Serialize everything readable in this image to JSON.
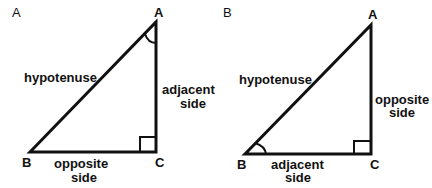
{
  "panels": [
    {
      "label": "A",
      "vertices": {
        "A": "A",
        "B": "B",
        "C": "C"
      },
      "marked_angle": "A",
      "sides": {
        "hypotenuse": "hypotenuse",
        "vertical": [
          "adjacent",
          "side"
        ],
        "horizontal": [
          "opposite",
          "side"
        ]
      }
    },
    {
      "label": "B",
      "vertices": {
        "A": "A",
        "B": "B",
        "C": "C"
      },
      "marked_angle": "B",
      "sides": {
        "hypotenuse": "hypotenuse",
        "vertical": [
          "opposite",
          "side"
        ],
        "horizontal": [
          "adjacent",
          "side"
        ]
      }
    }
  ],
  "colors": {
    "stroke": "#111111",
    "background": "#ffffff"
  }
}
